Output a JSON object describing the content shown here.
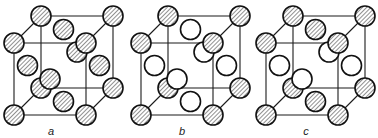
{
  "figure": {
    "legend": {
      "hatched": "atom type A (hatched fill)",
      "open": "atom type B (open/white fill)"
    },
    "colors": {
      "line": "#1a1a1a",
      "hatch": "#555555",
      "open_fill": "#ffffff"
    },
    "panels": [
      {
        "label": "a",
        "face_centers": {
          "top": "hatched",
          "bottom": "hatched",
          "front": "hatched",
          "back": "hatched",
          "left": "hatched",
          "right": "hatched"
        },
        "corners": "hatched"
      },
      {
        "label": "b",
        "face_centers": {
          "top": "open",
          "bottom": "open",
          "front": "open",
          "back": "open",
          "left": "open",
          "right": "open"
        },
        "corners": "hatched"
      },
      {
        "label": "c",
        "face_centers": {
          "top": "hatched",
          "bottom": "hatched",
          "front": "open",
          "back": "open",
          "left": "open",
          "right": "open"
        },
        "corners": "hatched"
      }
    ]
  }
}
